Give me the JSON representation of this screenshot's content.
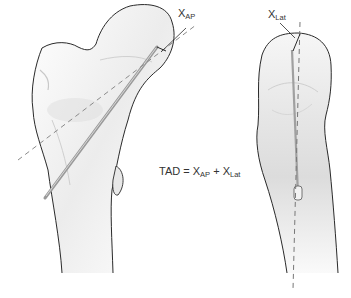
{
  "labels": {
    "xap": {
      "main": "X",
      "sub": "AP"
    },
    "xlat": {
      "main": "X",
      "sub": "Lat"
    }
  },
  "formula": {
    "lhs": "TAD = ",
    "term1": {
      "main": "X",
      "sub": "AP"
    },
    "plus": " + ",
    "term2": {
      "main": "X",
      "sub": "Lat"
    }
  },
  "views": [
    {
      "name": "AP view",
      "description": "Anteroposterior view of proximal femur with lag screw and dashed femoral neck axis"
    },
    {
      "name": "Lateral view",
      "description": "Lateral view of proximal femur with lag screw and dashed neck axis"
    }
  ],
  "colors": {
    "outline": "#2a2a2a",
    "screw": "#9a9a9a",
    "dashed_axis": "#8a8a8a",
    "bone_shade": "#e4e4e4",
    "text": "#333333"
  }
}
